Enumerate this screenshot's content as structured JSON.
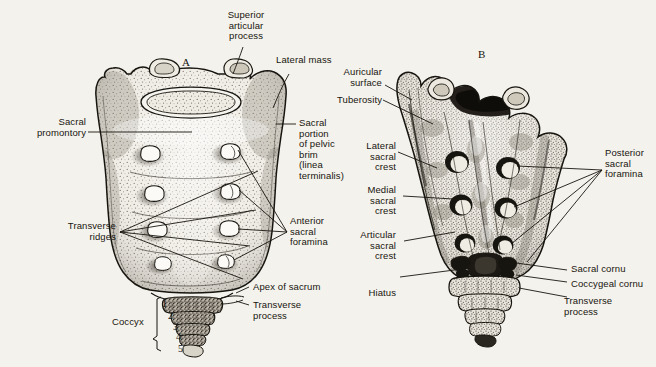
{
  "figure": {
    "panels": [
      {
        "letter": "A",
        "name": "anterior-view"
      },
      {
        "letter": "B",
        "name": "posterior-view"
      }
    ]
  },
  "labels_left": [
    {
      "id": "superior-articular-process",
      "text": "Superior\narticular\nprocess"
    },
    {
      "id": "sacral-promontory",
      "text": "Sacral\npromontory"
    },
    {
      "id": "transverse-ridges",
      "text": "Transverse\nridges"
    },
    {
      "id": "coccyx",
      "text": "Coccyx"
    }
  ],
  "labels_center": [
    {
      "id": "lateral-mass",
      "text": "Lateral mass"
    },
    {
      "id": "sacral-portion-pelvic-brim",
      "text": "Sacral\nportion\nof pelvic\nbrim\n(linea\nterminalis)"
    },
    {
      "id": "anterior-sacral-foramina",
      "text": "Anterior\nsacral\nforamina"
    },
    {
      "id": "apex-of-sacrum",
      "text": "Apex of sacrum"
    },
    {
      "id": "transverse-process-a",
      "text": "Transverse\nprocess"
    }
  ],
  "labels_b_left": [
    {
      "id": "auricular-surface",
      "text": "Auricular\nsurface"
    },
    {
      "id": "tuberosity",
      "text": "Tuberosity"
    },
    {
      "id": "lateral-sacral-crest",
      "text": "Lateral\nsacral\ncrest"
    },
    {
      "id": "medial-sacral-crest",
      "text": "Medial\nsacral\ncrest"
    },
    {
      "id": "articular-sacral-crest",
      "text": "Articular\nsacral\ncrest"
    },
    {
      "id": "hiatus",
      "text": "Hiatus"
    }
  ],
  "labels_b_right": [
    {
      "id": "posterior-sacral-foramina",
      "text": "Posterior\nsacral\nforamina"
    },
    {
      "id": "sacral-cornu",
      "text": "Sacral cornu"
    },
    {
      "id": "coccygeal-cornu",
      "text": "Coccygeal cornu"
    },
    {
      "id": "transverse-process-b",
      "text": "Transverse\nprocess"
    }
  ],
  "coccyx_segments": [
    "1",
    "2",
    "3",
    "4",
    "5"
  ],
  "colors": {
    "paper": "#f4f2ec",
    "ink": "#17150f",
    "bone_light": "#efece4",
    "bone_mid": "#cfc9bb",
    "bone_shade": "#9d9588",
    "bone_dark": "#2b2720"
  }
}
